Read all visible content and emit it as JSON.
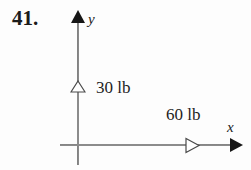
{
  "figure": {
    "problem_number": "41.",
    "axes": {
      "y_label": "y",
      "x_label": "x",
      "origin": {
        "x": 78,
        "y": 145
      },
      "axis_color": "#6b6b6b",
      "arrowhead_color": "#161616"
    },
    "forces": [
      {
        "name": "vertical-force",
        "label": "30 lb",
        "magnitude": 30,
        "unit": "lb",
        "direction": "up",
        "along_axis": "y",
        "arrowhead_style": "hollow",
        "shaft_color": "#8c8c8c"
      },
      {
        "name": "horizontal-force",
        "label": "60 lb",
        "magnitude": 60,
        "unit": "lb",
        "direction": "right",
        "along_axis": "x",
        "arrowhead_style": "hollow",
        "shaft_color": "#8c8c8c"
      }
    ]
  }
}
